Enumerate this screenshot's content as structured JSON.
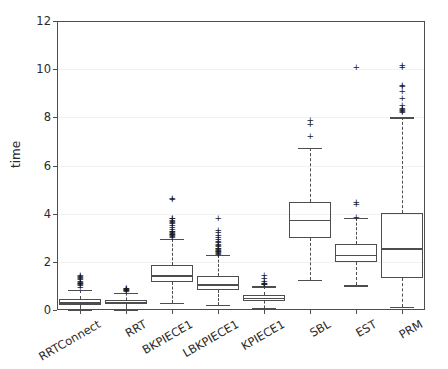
{
  "chart_data": {
    "type": "box",
    "title": "",
    "xlabel": "",
    "ylabel": "time",
    "ylim": [
      0,
      12
    ],
    "yticks": [
      0,
      2,
      4,
      6,
      8,
      10,
      12
    ],
    "ytick_labels": [
      "0",
      "2",
      "4",
      "6",
      "8",
      "10",
      "12"
    ],
    "grid": true,
    "grid_axis": "y",
    "legend": "none",
    "categories": [
      "RRTConnect",
      "RRT",
      "BKPIECE1",
      "LBKPIECE1",
      "KPIECE1",
      "SBL",
      "EST",
      "PRM"
    ],
    "boxes": [
      {
        "label": "RRTConnect",
        "q1": 0.22,
        "median": 0.32,
        "q3": 0.44,
        "whisker_low": 0.02,
        "whisker_high": 0.85,
        "fliers": [
          0.95,
          1.0,
          1.05,
          1.12,
          1.18,
          1.25,
          1.3,
          1.34,
          1.38,
          1.42,
          1.08,
          1.15
        ]
      },
      {
        "label": "RRT",
        "q1": 0.24,
        "median": 0.32,
        "q3": 0.4,
        "whisker_low": 0.03,
        "whisker_high": 0.72,
        "fliers": [
          0.78,
          0.82,
          0.85,
          0.88,
          0.9,
          0.8,
          0.86
        ]
      },
      {
        "label": "BKPIECE1",
        "q1": 1.15,
        "median": 1.44,
        "q3": 1.88,
        "whisker_low": 0.3,
        "whisker_high": 2.96,
        "fliers": [
          3.02,
          3.08,
          3.12,
          3.18,
          3.22,
          3.28,
          3.35,
          3.42,
          3.5,
          3.58,
          3.62,
          3.68,
          3.72,
          3.78,
          3.82,
          4.58,
          4.64,
          3.05,
          3.15,
          3.25
        ]
      },
      {
        "label": "LBKPIECE1",
        "q1": 0.82,
        "median": 1.06,
        "q3": 1.42,
        "whisker_low": 0.2,
        "whisker_high": 2.28,
        "fliers": [
          2.32,
          2.38,
          2.44,
          2.5,
          2.56,
          2.62,
          2.68,
          2.74,
          2.8,
          2.86,
          2.92,
          3.0,
          3.1,
          3.2,
          3.3,
          3.8,
          2.35,
          2.42,
          2.48,
          2.55
        ]
      },
      {
        "label": "KPIECE1",
        "q1": 0.38,
        "median": 0.5,
        "q3": 0.62,
        "whisker_low": 0.1,
        "whisker_high": 0.98,
        "fliers": [
          1.04,
          1.1,
          1.18,
          1.3,
          1.44,
          1.06,
          1.12
        ]
      },
      {
        "label": "SBL",
        "q1": 2.98,
        "median": 3.74,
        "q3": 4.5,
        "whisker_low": 1.26,
        "whisker_high": 6.72,
        "fliers": [
          7.2,
          7.72,
          7.86
        ]
      },
      {
        "label": "EST",
        "q1": 2.0,
        "median": 2.3,
        "q3": 2.74,
        "whisker_low": 1.02,
        "whisker_high": 3.82,
        "fliers": [
          3.86,
          4.4,
          4.48,
          10.08
        ]
      },
      {
        "label": "PRM",
        "q1": 1.34,
        "median": 2.56,
        "q3": 4.04,
        "whisker_low": 0.14,
        "whisker_high": 8.0,
        "fliers": [
          8.2,
          8.3,
          8.38,
          8.5,
          8.78,
          9.06,
          9.26,
          9.34,
          10.06,
          10.14,
          8.25,
          8.34
        ]
      }
    ],
    "colors": {
      "line": "#4d4d4d",
      "flier": "#1a1a1a",
      "grid": "#f2f2f2",
      "background": "#ffffff",
      "text": "#2b2b2b"
    }
  }
}
